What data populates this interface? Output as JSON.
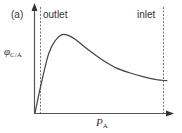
{
  "panel_label": "(a)",
  "annotations": {
    "outlet": "outlet",
    "inlet": "inlet"
  },
  "axes": {
    "ylabel_symbol": "φ",
    "ylabel_sub": "C/A",
    "xlabel_symbol": "P",
    "xlabel_sub": "A"
  },
  "colors": {
    "axis": "#555555",
    "curve": "#444444",
    "dashed": "#777777"
  },
  "chart_data": {
    "type": "line",
    "title": "(a)",
    "xlabel": "P_A",
    "ylabel": "φ_C/A",
    "grid": false,
    "legend": null,
    "annotations": [
      {
        "text": "outlet",
        "type": "vertical-dashed-line",
        "x": 0.04
      },
      {
        "text": "inlet",
        "type": "vertical-dashed-line",
        "x": 0.93
      }
    ],
    "series": [
      {
        "name": "φ_C/A vs P_A",
        "x": [
          0.0,
          0.04,
          0.1,
          0.15,
          0.2,
          0.25,
          0.3,
          0.4,
          0.5,
          0.6,
          0.7,
          0.8,
          0.9,
          0.98
        ],
        "y": [
          0.0,
          0.26,
          0.6,
          0.74,
          0.8,
          0.79,
          0.75,
          0.64,
          0.54,
          0.46,
          0.41,
          0.37,
          0.34,
          0.33
        ]
      }
    ],
    "xlim": [
      0,
      1
    ],
    "ylim": [
      0,
      1
    ],
    "ticks": "none"
  }
}
